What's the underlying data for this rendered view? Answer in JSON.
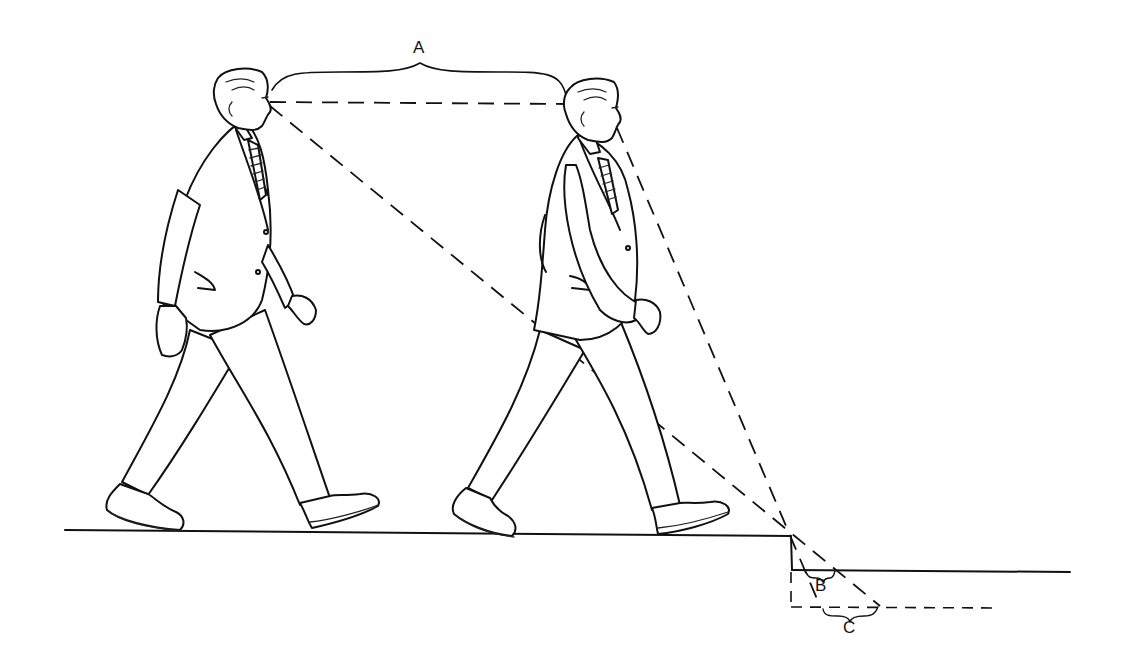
{
  "illustration": {
    "subject": "Two men in suits walking toward a step-down edge, showing sight lines",
    "labels": {
      "a": "A",
      "b": "B",
      "c": "C"
    },
    "colors": {
      "ink": "#111111",
      "background": "#ffffff"
    }
  }
}
